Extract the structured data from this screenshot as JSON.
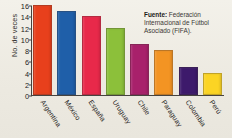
{
  "chart_data": {
    "type": "bar",
    "title": "",
    "xlabel": "",
    "ylabel": "No. de veces",
    "ylim": [
      0,
      16
    ],
    "ytick_step": 2,
    "grid": false,
    "legend": "none",
    "categories": [
      "Argentina",
      "México",
      "España",
      "Uruguay",
      "Chile",
      "Paraguay",
      "Colombia",
      "Perú"
    ],
    "values": [
      16,
      15,
      14,
      12,
      9,
      8,
      5,
      4
    ],
    "yticks": [
      "0",
      "2",
      "4",
      "6",
      "8",
      "10",
      "12",
      "14",
      "16"
    ],
    "bar_colors": [
      "#E8401C",
      "#1F5FA9",
      "#E8294A",
      "#8CC03A",
      "#A8216B",
      "#F39423",
      "#3D1A6B",
      "#FBD424"
    ],
    "annotations": [
      "Fuente: Federación Internacional de Fútbol Asociado (FIFA)."
    ]
  },
  "axis": {
    "y_title": "No. de veces"
  },
  "source": {
    "label": "Fuente:",
    "line1": " Federación",
    "line2": "Internacional de Fútbol",
    "line3": "Asociado (FIFA)."
  }
}
